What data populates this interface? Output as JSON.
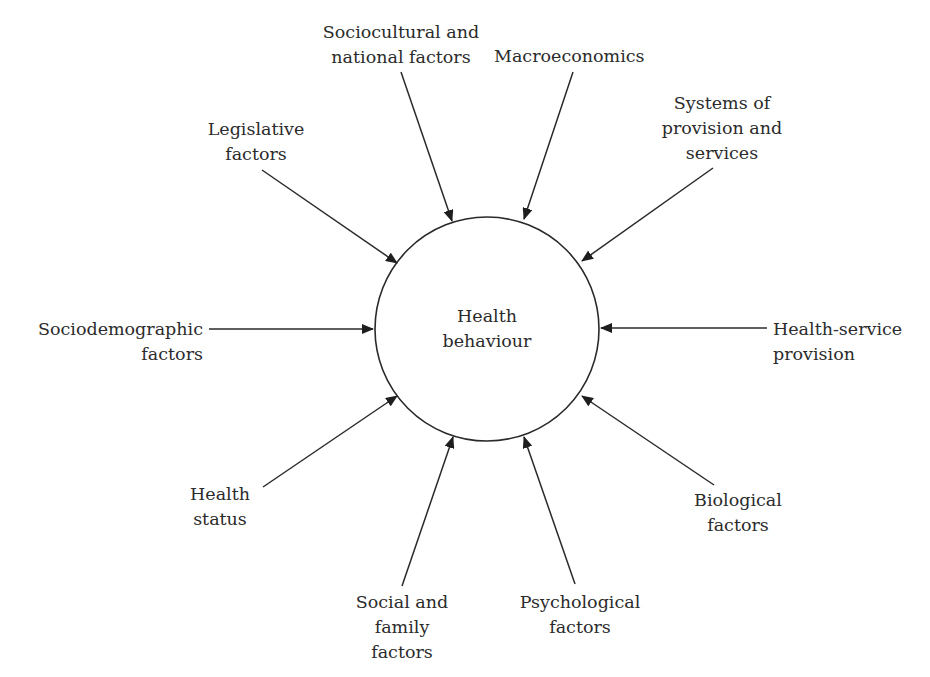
{
  "diagram": {
    "type": "radial-influence-diagram",
    "center": {
      "lines": [
        "Health",
        "behaviour"
      ],
      "cx": 487,
      "cy": 329,
      "r": 112
    },
    "stroke_color": "#2a2a2a",
    "factors": [
      {
        "id": "sociocultural",
        "lines": [
          "Sociocultural and",
          "national factors"
        ],
        "from": [
          401,
          72
        ],
        "to": [
          452,
          221
        ]
      },
      {
        "id": "macroeconomics",
        "lines": [
          "Macroeconomics"
        ],
        "from": [
          573,
          72
        ],
        "to": [
          524,
          219
        ]
      },
      {
        "id": "systems",
        "lines": [
          "Systems of",
          "provision and",
          "services"
        ],
        "from": [
          713,
          168
        ],
        "to": [
          582,
          261
        ]
      },
      {
        "id": "legislative",
        "lines": [
          "Legislative",
          "factors"
        ],
        "from": [
          262,
          170
        ],
        "to": [
          397,
          263
        ]
      },
      {
        "id": "sociodemographic",
        "lines": [
          "Sociodemographic",
          "factors"
        ],
        "from": [
          209,
          329
        ],
        "to": [
          373,
          329
        ]
      },
      {
        "id": "health-service",
        "lines": [
          "Health-service",
          "provision"
        ],
        "from": [
          767,
          328
        ],
        "to": [
          601,
          328
        ]
      },
      {
        "id": "biological",
        "lines": [
          "Biological",
          "factors"
        ],
        "from": [
          714,
          485
        ],
        "to": [
          582,
          396
        ]
      },
      {
        "id": "health-status",
        "lines": [
          "Health",
          "status"
        ],
        "from": [
          263,
          487
        ],
        "to": [
          397,
          396
        ]
      },
      {
        "id": "social-family",
        "lines": [
          "Social and",
          "family",
          "factors"
        ],
        "from": [
          402,
          586
        ],
        "to": [
          453,
          437
        ]
      },
      {
        "id": "psychological",
        "lines": [
          "Psychological",
          "factors"
        ],
        "from": [
          575,
          584
        ],
        "to": [
          524,
          437
        ]
      }
    ]
  }
}
